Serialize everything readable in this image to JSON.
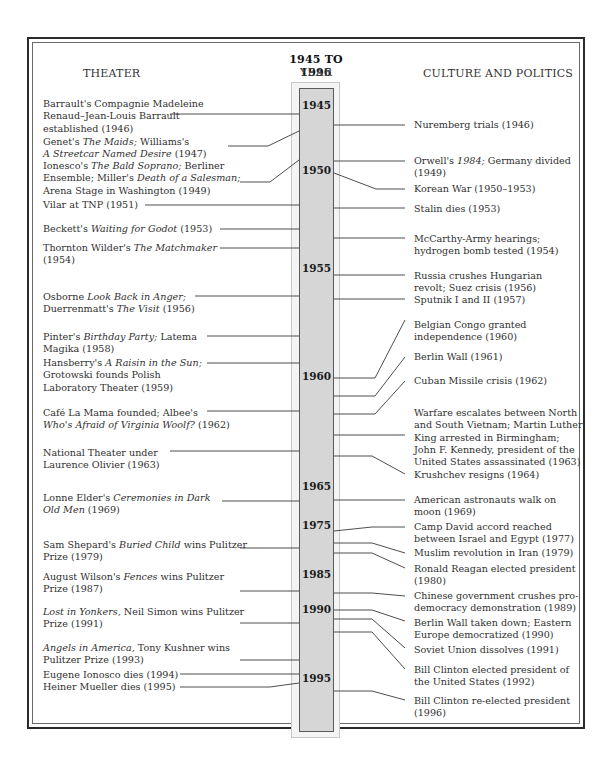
{
  "title": {
    "range": "1945 TO 1996",
    "year_label": "YEAR",
    "left_header": "THEATER",
    "right_header": "CULTURE AND POLITICS"
  },
  "timeline": {
    "years": [
      "1945",
      "1950",
      "1955",
      "1960",
      "1965",
      "1975",
      "1985",
      "1990",
      "1995"
    ]
  },
  "theater": [
    {
      "pre": "Barrault's Compagnie Madeleine Renaud–Jean-Louis Barrault established (1946)"
    },
    {
      "pre": "Genet's ",
      "it": "The Maids;",
      "post": " Williams's"
    },
    {
      "it": "A Streetcar Named Desire",
      "post": " (1947)"
    },
    {
      "pre": "Ionesco's ",
      "it": "The Bald Soprano;",
      "post": " Berliner"
    },
    {
      "pre": "Ensemble; Miller's ",
      "it": "Death of a Salesman;"
    },
    {
      "pre": "Arena Stage in Washington (1949)"
    },
    {
      "pre": "Vilar at TNP (1951)"
    },
    {
      "pre": "Beckett's ",
      "it": "Waiting for Godot",
      "post": " (1953)"
    },
    {
      "pre": "Thornton Wilder's ",
      "it": "The Matchmaker"
    },
    {
      "pre": "(1954)"
    },
    {
      "pre": "Osborne ",
      "it": "Look Back in Anger;"
    },
    {
      "pre": "Duerrenmatt's ",
      "it": "The Visit",
      "post": " (1956)"
    },
    {
      "pre": "Pinter's ",
      "it": "Birthday Party;",
      "post": " Latema"
    },
    {
      "pre": "Magika (1958)"
    },
    {
      "pre": "Hansberry's ",
      "it": "A Raisin in the Sun;"
    },
    {
      "pre": "Grotowski founds Polish"
    },
    {
      "pre": "Laboratory Theater (1959)"
    },
    {
      "pre": "Café La Mama founded; Albee's"
    },
    {
      "it": "Who's Afraid of Virginia Woolf?",
      "post": " (1962)"
    },
    {
      "pre": "National Theater under"
    },
    {
      "pre": "Laurence Olivier (1963)"
    },
    {
      "pre": "Lonne Elder's ",
      "it": "Ceremonies in Dark"
    },
    {
      "it": "Old Men",
      "post": " (1969)"
    },
    {
      "pre": "Sam Shepard's ",
      "it": "Buried Child",
      "post": " wins Pulitzer"
    },
    {
      "pre": "Prize (1979)"
    },
    {
      "pre": "August Wilson's ",
      "it": "Fences",
      "post": " wins Pulitzer"
    },
    {
      "pre": "Prize (1987)"
    },
    {
      "it": "Lost in Yonkers,",
      "post": " Neil Simon wins Pulitzer"
    },
    {
      "pre": "Prize (1991)"
    },
    {
      "it": "Angels in America,",
      "post": " Tony Kushner wins"
    },
    {
      "pre": "Pulitzer Prize (1993)"
    },
    {
      "pre": "Eugene Ionosco dies (1994)"
    },
    {
      "pre": "Heiner Mueller dies (1995)"
    }
  ],
  "theater_first_lines": [
    "Barrault's Compagnie Madeleine",
    "Renaud–Jean-Louis Barrault",
    "established (1946)"
  ],
  "culture": [
    "Nuremberg trials (1946)",
    "Orwell's |1984;| Germany divided",
    "(1949)",
    "Korean War (1950–1953)",
    "Stalin dies (1953)",
    "McCarthy-Army hearings;",
    "hydrogen bomb tested (1954)",
    "Russia crushes Hungarian",
    "revolt; Suez crisis (1956)",
    "Sputnik I and II (1957)",
    "Belgian Congo granted",
    "independence (1960)",
    "Berlin Wall (1961)",
    "Cuban Missile crisis (1962)",
    "Warfare escalates between North",
    "and South Vietnam; Martin Luther",
    "King arrested in Birmingham;",
    "John F. Kennedy, president of the",
    "United States assassinated (1963)",
    "Krushchev resigns (1964)",
    "American astronauts walk on",
    "moon (1969)",
    "Camp David accord reached",
    "between Israel and Egypt (1977)",
    "Muslim revolution in Iran (1979)",
    "Ronald Reagan elected president",
    "(1980)",
    "Chinese government crushes pro-",
    "democracy demonstration (1989)",
    "Berlin Wall taken down; Eastern",
    "Europe democratized (1990)",
    "Soviet Union dissolves (1991)",
    "Bill Clinton elected president of",
    "the United States (1992)",
    "Bill Clinton re-elected president",
    "(1996)"
  ],
  "culture_italic": "1984;"
}
